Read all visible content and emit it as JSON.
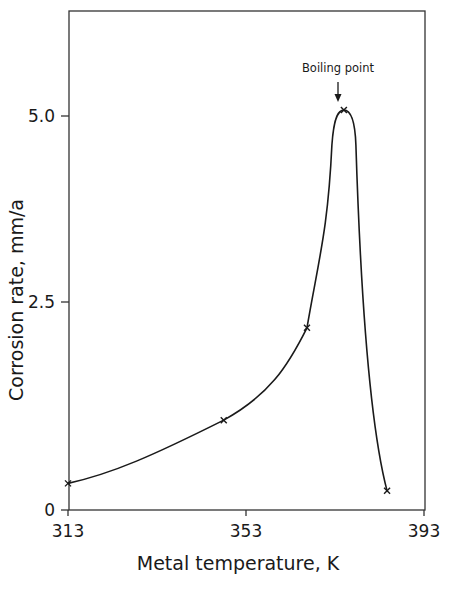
{
  "chart_data": {
    "type": "line",
    "title": "",
    "xlabel": "Metal temperature, K",
    "ylabel": "Corrosion rate, mm/a",
    "xlim": [
      313,
      393
    ],
    "ylim": [
      0,
      6.0
    ],
    "x_ticks": [
      313,
      353,
      393
    ],
    "x_tick_labels": [
      "313",
      "353",
      "393"
    ],
    "y_ticks": [
      0,
      2.5,
      5.0
    ],
    "y_tick_labels": [
      "0",
      "2.5",
      "5.0"
    ],
    "grid": false,
    "legend": null,
    "series": [
      {
        "name": "Corrosion rate",
        "marker": "x",
        "x": [
          313,
          348,
          366.7,
          375,
          384.7
        ],
        "values": [
          0.32,
          1.08,
          2.19,
          5.08,
          0.23
        ]
      }
    ],
    "annotations": [
      {
        "text": "Boiling point",
        "arrow_to": {
          "x": 375,
          "y": 5.08
        }
      }
    ]
  },
  "colors": {
    "line": "#1a1a1a",
    "axis": "#333333",
    "background": "#ffffff"
  }
}
